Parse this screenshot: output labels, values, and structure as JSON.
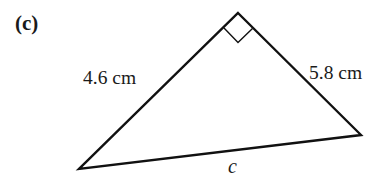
{
  "figure": {
    "part_label": "(c)",
    "shape": "right-triangle",
    "vertices": {
      "right_angle": [
        238,
        13
      ],
      "right": [
        361,
        135
      ],
      "bottom_left": [
        79,
        169
      ]
    },
    "right_angle_marker": true,
    "sides": {
      "left_leg": {
        "label": "4.6 cm",
        "value": 4.6,
        "unit": "cm"
      },
      "right_leg": {
        "label": "5.8 cm",
        "value": 5.8,
        "unit": "cm"
      },
      "hypotenuse": {
        "label": "c"
      }
    },
    "colors": {
      "stroke": "#111111",
      "text": "#1a1a1a",
      "background": "#ffffff"
    }
  }
}
